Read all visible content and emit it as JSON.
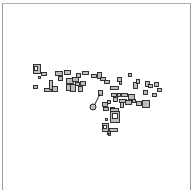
{
  "map": {
    "type": "building-footprint-plan",
    "background": "#ffffff",
    "frame_color": "#9a9a9a",
    "stroke_color": "#222222",
    "fill_color": "#bdbdbd",
    "buildings": [
      {
        "x": 33,
        "y": 64,
        "w": 7,
        "h": 9
      },
      {
        "x": 34,
        "y": 66,
        "w": 3,
        "h": 4,
        "inner": true
      },
      {
        "x": 41,
        "y": 72,
        "w": 5,
        "h": 3
      },
      {
        "x": 38,
        "y": 76,
        "w": 2,
        "h": 2
      },
      {
        "x": 33,
        "y": 85,
        "w": 4,
        "h": 3
      },
      {
        "x": 44,
        "y": 88,
        "w": 7,
        "h": 3
      },
      {
        "x": 49,
        "y": 80,
        "w": 3,
        "h": 9
      },
      {
        "x": 52,
        "y": 86,
        "w": 5,
        "h": 5
      },
      {
        "x": 55,
        "y": 71,
        "w": 7,
        "h": 4
      },
      {
        "x": 58,
        "y": 76,
        "w": 4,
        "h": 4
      },
      {
        "x": 64,
        "y": 70,
        "w": 6,
        "h": 4
      },
      {
        "x": 66,
        "y": 78,
        "w": 7,
        "h": 5
      },
      {
        "x": 66,
        "y": 84,
        "w": 4,
        "h": 6
      },
      {
        "x": 70,
        "y": 84,
        "w": 5,
        "h": 7
      },
      {
        "x": 72,
        "y": 77,
        "w": 6,
        "h": 4
      },
      {
        "x": 75,
        "y": 82,
        "w": 4,
        "h": 3
      },
      {
        "x": 76,
        "y": 73,
        "w": 4,
        "h": 4
      },
      {
        "x": 78,
        "y": 86,
        "w": 4,
        "h": 5
      },
      {
        "x": 80,
        "y": 81,
        "w": 5,
        "h": 4
      },
      {
        "x": 82,
        "y": 71,
        "w": 6,
        "h": 3
      },
      {
        "x": 91,
        "y": 74,
        "w": 5,
        "h": 3
      },
      {
        "x": 97,
        "y": 72,
        "w": 4,
        "h": 6
      },
      {
        "x": 100,
        "y": 77,
        "w": 5,
        "h": 3
      },
      {
        "x": 104,
        "y": 80,
        "w": 5,
        "h": 3
      },
      {
        "x": 110,
        "y": 86,
        "w": 8,
        "h": 3
      },
      {
        "x": 117,
        "y": 77,
        "w": 4,
        "h": 4
      },
      {
        "x": 119,
        "y": 81,
        "w": 2,
        "h": 3
      },
      {
        "x": 128,
        "y": 73,
        "w": 3,
        "h": 3
      },
      {
        "x": 133,
        "y": 82,
        "w": 4,
        "h": 6
      },
      {
        "x": 136,
        "y": 79,
        "w": 3,
        "h": 4
      },
      {
        "x": 145,
        "y": 81,
        "w": 4,
        "h": 5
      },
      {
        "x": 148,
        "y": 84,
        "w": 4,
        "h": 3
      },
      {
        "x": 154,
        "y": 82,
        "w": 4,
        "h": 4
      },
      {
        "x": 157,
        "y": 88,
        "w": 4,
        "h": 3
      },
      {
        "x": 143,
        "y": 90,
        "w": 4,
        "h": 4
      },
      {
        "x": 152,
        "y": 93,
        "w": 4,
        "h": 3
      },
      {
        "x": 98,
        "y": 90,
        "w": 4,
        "h": 5
      },
      {
        "x": 111,
        "y": 93,
        "w": 5,
        "h": 3
      },
      {
        "x": 117,
        "y": 93,
        "w": 3,
        "h": 3
      },
      {
        "x": 121,
        "y": 93,
        "w": 6,
        "h": 3
      },
      {
        "x": 128,
        "y": 94,
        "w": 6,
        "h": 5
      },
      {
        "x": 113,
        "y": 97,
        "w": 4,
        "h": 4
      },
      {
        "x": 119,
        "y": 99,
        "w": 7,
        "h": 3
      },
      {
        "x": 120,
        "y": 102,
        "w": 3,
        "h": 5
      },
      {
        "x": 125,
        "y": 100,
        "w": 6,
        "h": 4
      },
      {
        "x": 132,
        "y": 99,
        "w": 3,
        "h": 3
      },
      {
        "x": 136,
        "y": 101,
        "w": 5,
        "h": 4
      },
      {
        "x": 142,
        "y": 100,
        "w": 7,
        "h": 7
      },
      {
        "x": 102,
        "y": 102,
        "w": 5,
        "h": 4
      },
      {
        "x": 107,
        "y": 100,
        "w": 3,
        "h": 3
      },
      {
        "x": 103,
        "y": 107,
        "w": 5,
        "h": 3
      },
      {
        "x": 110,
        "y": 107,
        "w": 4,
        "h": 3
      },
      {
        "x": 110,
        "y": 108,
        "w": 8,
        "h": 3
      },
      {
        "x": 110,
        "y": 111,
        "w": 9,
        "h": 11
      },
      {
        "x": 112,
        "y": 113,
        "w": 5,
        "h": 5,
        "inner": true
      },
      {
        "x": 105,
        "y": 118,
        "w": 2,
        "h": 2
      },
      {
        "x": 102,
        "y": 123,
        "w": 6,
        "h": 8
      },
      {
        "x": 103,
        "y": 125,
        "w": 3,
        "h": 3,
        "inner": true
      },
      {
        "x": 109,
        "y": 128,
        "w": 8,
        "h": 3
      },
      {
        "x": 107,
        "y": 131,
        "w": 3,
        "h": 3
      },
      {
        "x": 108,
        "y": 133,
        "w": 2,
        "h": 2
      }
    ],
    "line": {
      "x1": 94,
      "y1": 106,
      "x2": 100,
      "y2": 94
    },
    "marker": {
      "cx": 93,
      "cy": 107,
      "r": 3
    }
  }
}
